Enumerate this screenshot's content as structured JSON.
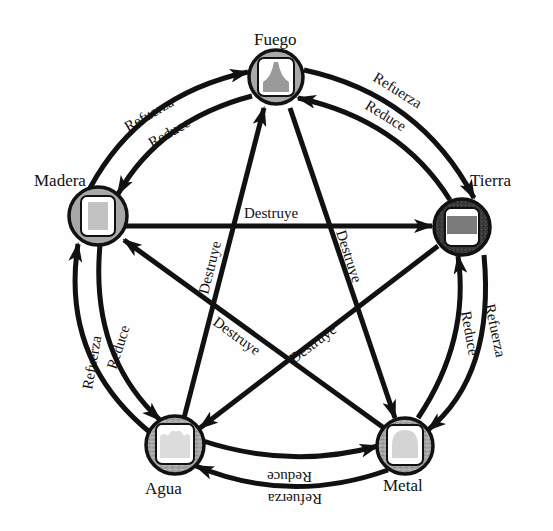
{
  "diagram": {
    "title": "",
    "nodes": [
      {
        "id": "fuego",
        "label": "Fuego",
        "icon": "flame-shape-icon",
        "ring_color": "#a8a8a8"
      },
      {
        "id": "tierra",
        "label": "Tierra",
        "icon": "earth-band-icon",
        "ring_color": "#3a3a3a"
      },
      {
        "id": "metal",
        "label": "Metal",
        "icon": "dome-shape-icon",
        "ring_color": "#9a9a9a"
      },
      {
        "id": "agua",
        "label": "Agua",
        "icon": "wave-shape-icon",
        "ring_color": "#a0a0a0"
      },
      {
        "id": "madera",
        "label": "Madera",
        "icon": "wood-block-icon",
        "ring_color": "#a8a8a8"
      }
    ],
    "edges": [
      {
        "from": "madera",
        "to": "fuego",
        "label": "Refuerza",
        "type": "outer-cycle"
      },
      {
        "from": "fuego",
        "to": "tierra",
        "label": "Refuerza",
        "type": "outer-cycle"
      },
      {
        "from": "tierra",
        "to": "metal",
        "label": "Refuerza",
        "type": "outer-cycle"
      },
      {
        "from": "metal",
        "to": "agua",
        "label": "Refuerza",
        "type": "outer-cycle"
      },
      {
        "from": "agua",
        "to": "madera",
        "label": "Refuerza",
        "type": "outer-cycle"
      },
      {
        "from": "fuego",
        "to": "madera",
        "label": "Reduce",
        "type": "inner-cycle"
      },
      {
        "from": "tierra",
        "to": "fuego",
        "label": "Reduce",
        "type": "inner-cycle"
      },
      {
        "from": "metal",
        "to": "tierra",
        "label": "Reduce",
        "type": "inner-cycle"
      },
      {
        "from": "agua",
        "to": "metal",
        "label": "Reduce",
        "type": "inner-cycle"
      },
      {
        "from": "madera",
        "to": "agua",
        "label": "Reduce",
        "type": "inner-cycle"
      },
      {
        "from": "madera",
        "to": "tierra",
        "label": "Destruye",
        "type": "star"
      },
      {
        "from": "tierra",
        "to": "agua",
        "label": "Destruye",
        "type": "star"
      },
      {
        "from": "agua",
        "to": "fuego",
        "label": "Destruye",
        "type": "star"
      },
      {
        "from": "fuego",
        "to": "metal",
        "label": "Destruye",
        "type": "star"
      },
      {
        "from": "metal",
        "to": "madera",
        "label": "Destruye",
        "type": "star"
      }
    ]
  },
  "labels": {
    "fuego": "Fuego",
    "tierra": "Tierra",
    "metal": "Metal",
    "agua": "Agua",
    "madera": "Madera",
    "refuerza": "Refuerza",
    "reduce": "Reduce",
    "destruye": "Destruye"
  }
}
